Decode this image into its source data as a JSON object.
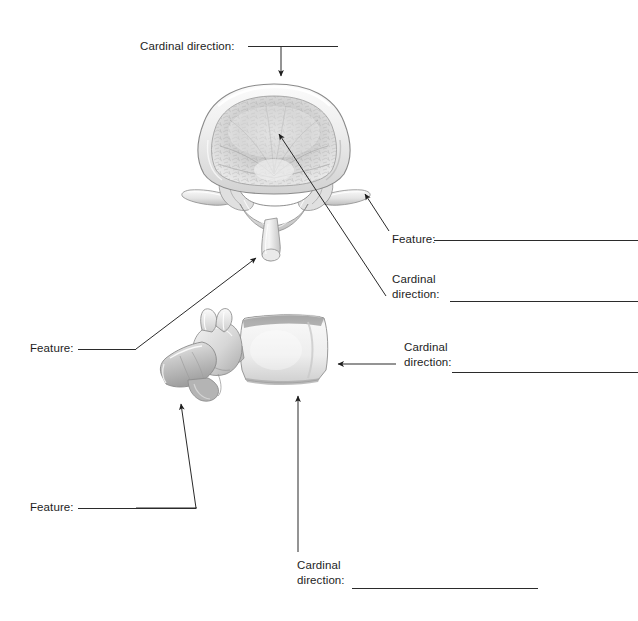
{
  "page": {
    "background_color": "#ffffff",
    "ink_color": "#1d1d1d",
    "width": 638,
    "height": 621
  },
  "figures": [
    {
      "id": "superior-view-vertebra",
      "name": "lumbar-vertebra-superior-view",
      "description": "Superior (top-down) view of a lumbar vertebra showing the vertebral body, vertebral foramen, transverse processes and spinous process",
      "bounds": {
        "x": 183,
        "y": 84,
        "width": 184,
        "height": 174
      }
    },
    {
      "id": "lateral-view-vertebra",
      "name": "lumbar-vertebra-lateral-view",
      "description": "Left lateral view of a lumbar vertebra showing the vertebral body, pedicle, superior and inferior articular processes and spinous process",
      "bounds": {
        "x": 163,
        "y": 313,
        "width": 175,
        "height": 88
      }
    }
  ],
  "labels": [
    {
      "id": "label-1",
      "name": "cardinal-direction-top",
      "prompt": "Cardinal direction:",
      "answer": "",
      "lines": [
        "Cardinal direction:"
      ],
      "text_x": 140,
      "text_y": 39,
      "rule": {
        "x": 248,
        "y": 46,
        "width": 90
      },
      "points_to": "top of the vertebral body, superior view"
    },
    {
      "id": "label-2",
      "name": "feature-transverse-process",
      "prompt": "Feature:",
      "answer": "",
      "lines": [
        "Feature:"
      ],
      "text_x": 392,
      "text_y": 232,
      "rule": {
        "x": 434,
        "y": 240,
        "width": 204
      },
      "points_to": "right transverse process, superior view"
    },
    {
      "id": "label-3",
      "name": "cardinal-direction-vertebral-body",
      "prompt": "Cardinal direction:",
      "answer": "",
      "lines": [
        "Cardinal",
        "direction:"
      ],
      "text_x": 392,
      "text_y": 272,
      "rule": {
        "x": 450,
        "y": 301,
        "width": 188
      },
      "points_to": "centre of the vertebral body, superior view"
    },
    {
      "id": "label-4",
      "name": "feature-spinous-process",
      "prompt": "Feature:",
      "answer": "",
      "lines": [
        "Feature:"
      ],
      "text_x": 30,
      "text_y": 341,
      "rule": {
        "x": 78,
        "y": 349,
        "width": 58
      },
      "points_to": "spinous process tip, superior view"
    },
    {
      "id": "label-5",
      "name": "cardinal-direction-anterior-body",
      "prompt": "Cardinal direction:",
      "answer": "",
      "lines": [
        "Cardinal",
        "direction:"
      ],
      "text_x": 404,
      "text_y": 340,
      "rule": {
        "x": 452,
        "y": 372,
        "width": 186
      },
      "points_to": "anterior surface of the vertebral body, lateral view"
    },
    {
      "id": "label-6",
      "name": "feature-inferior-articular-process",
      "prompt": "Feature:",
      "answer": "",
      "lines": [
        "Feature:"
      ],
      "text_x": 30,
      "text_y": 500,
      "rule": {
        "x": 78,
        "y": 508,
        "width": 118
      },
      "points_to": "inferior articular process, lateral view"
    },
    {
      "id": "label-7",
      "name": "cardinal-direction-inferior-body",
      "prompt": "Cardinal direction:",
      "answer": "",
      "lines": [
        "Cardinal",
        "direction:"
      ],
      "text_x": 297,
      "text_y": 558,
      "rule": {
        "x": 352,
        "y": 588,
        "width": 186
      },
      "points_to": "inferior surface of the vertebral body, lateral view"
    }
  ],
  "leaders": [
    {
      "name": "leader-cardinal-direction-top",
      "kind": "elbow-down-arrow"
    },
    {
      "name": "leader-feature-transverse-process",
      "kind": "diagonal-arrow"
    },
    {
      "name": "leader-cardinal-direction-vertebral-body",
      "kind": "diagonal-arrow"
    },
    {
      "name": "leader-feature-spinous-process",
      "kind": "diagonal-arrow"
    },
    {
      "name": "leader-cardinal-direction-anterior-body",
      "kind": "horizontal-arrow"
    },
    {
      "name": "leader-feature-inferior-articular-process",
      "kind": "elbow-arrow"
    },
    {
      "name": "leader-cardinal-direction-inferior-body",
      "kind": "vertical-arrow"
    }
  ]
}
